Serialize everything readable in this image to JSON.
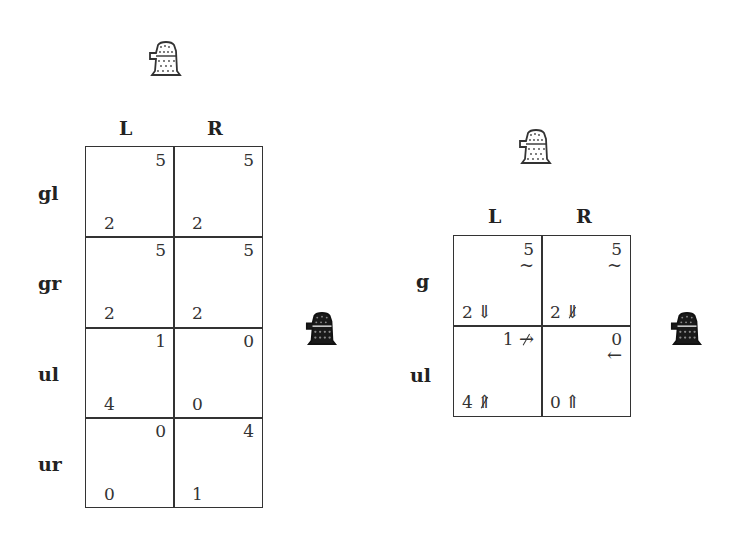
{
  "left_game": {
    "column_player_icon": "robot-light-icon",
    "row_player_icon": "robot-dark-icon",
    "columns": [
      "L",
      "R"
    ],
    "rows": [
      {
        "label": "gl",
        "cells": [
          {
            "row_payoff": "2",
            "col_payoff": "5"
          },
          {
            "row_payoff": "2",
            "col_payoff": "5"
          }
        ]
      },
      {
        "label": "gr",
        "cells": [
          {
            "row_payoff": "2",
            "col_payoff": "5"
          },
          {
            "row_payoff": "2",
            "col_payoff": "5"
          }
        ]
      },
      {
        "label": "ul",
        "cells": [
          {
            "row_payoff": "4",
            "col_payoff": "1"
          },
          {
            "row_payoff": "0",
            "col_payoff": "0"
          }
        ]
      },
      {
        "label": "ur",
        "cells": [
          {
            "row_payoff": "0",
            "col_payoff": "0"
          },
          {
            "row_payoff": "1",
            "col_payoff": "4"
          }
        ]
      }
    ]
  },
  "right_game": {
    "column_player_icon": "robot-light-icon",
    "row_player_icon": "robot-dark-icon",
    "columns": [
      "L",
      "R"
    ],
    "rows": [
      {
        "label": "g",
        "cells": [
          {
            "row_payoff": "2",
            "row_arrow": "⇓",
            "row_arrow_struck": false,
            "col_payoff": "5",
            "col_mark": "~",
            "col_arrow": "",
            "col_arrow_struck": false
          },
          {
            "row_payoff": "2",
            "row_arrow": "⇓",
            "row_arrow_struck": true,
            "col_payoff": "5",
            "col_mark": "~",
            "col_arrow": "",
            "col_arrow_struck": false
          }
        ]
      },
      {
        "label": "ul",
        "cells": [
          {
            "row_payoff": "4",
            "row_arrow": "⇑",
            "row_arrow_struck": true,
            "col_payoff": "1",
            "col_mark": "",
            "col_arrow": "→",
            "col_arrow_struck": true
          },
          {
            "row_payoff": "0",
            "row_arrow": "⇑",
            "row_arrow_struck": false,
            "col_payoff": "0",
            "col_mark": "",
            "col_arrow": "←",
            "col_arrow_struck": false
          }
        ]
      }
    ]
  }
}
